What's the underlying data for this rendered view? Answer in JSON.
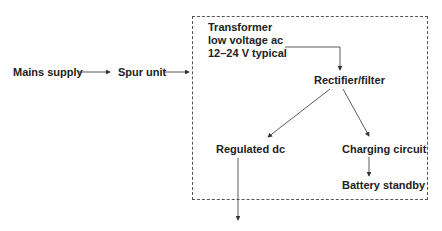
{
  "diagram": {
    "nodes": {
      "mains": "Mains supply",
      "spur": "Spur unit",
      "transformer": [
        "Transformer",
        "low voltage ac",
        "12–24 V typical"
      ],
      "rectifier": "Rectifier/filter",
      "regulated": "Regulated dc",
      "charging": "Charging circuit",
      "battery": "Battery standby"
    },
    "edges": [
      {
        "from": "Mains supply",
        "to": "Spur unit"
      },
      {
        "from": "Spur unit",
        "to": "Power supply enclosure"
      },
      {
        "from": "Transformer",
        "to": "Rectifier/filter"
      },
      {
        "from": "Rectifier/filter",
        "to": "Regulated dc"
      },
      {
        "from": "Rectifier/filter",
        "to": "Charging circuit"
      },
      {
        "from": "Charging circuit",
        "to": "Battery standby"
      },
      {
        "from": "Regulated dc",
        "to": "output"
      }
    ],
    "colors": {
      "line": "#333333",
      "text": "#222222",
      "border": "#555555"
    }
  }
}
